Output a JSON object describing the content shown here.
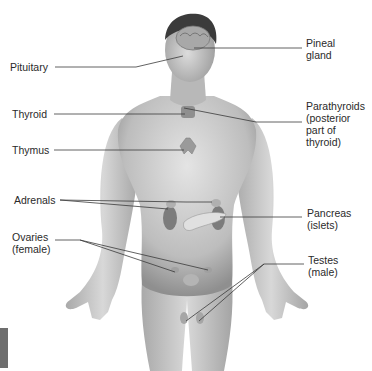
{
  "diagram": {
    "labels_left": [
      {
        "id": "pituitary",
        "text": "Pituitary",
        "x": 10,
        "y": 61
      },
      {
        "id": "thyroid",
        "text": "Thyroid",
        "x": 12,
        "y": 108
      },
      {
        "id": "thymus",
        "text": "Thymus",
        "x": 12,
        "y": 144
      },
      {
        "id": "adrenals",
        "text": "Adrenals",
        "x": 14,
        "y": 194
      },
      {
        "id": "ovaries",
        "text": "Ovaries\n(female)",
        "x": 12,
        "y": 231
      }
    ],
    "labels_right": [
      {
        "id": "pineal",
        "text": "Pineal\ngland",
        "x": 306,
        "y": 37
      },
      {
        "id": "parathyroids",
        "text": "Parathyroids\n(posterior\npart of\nthyroid)",
        "x": 306,
        "y": 100
      },
      {
        "id": "pancreas",
        "text": "Pancreas\n(islets)",
        "x": 307,
        "y": 207
      },
      {
        "id": "testes",
        "text": "Testes\n(male)",
        "x": 308,
        "y": 254
      }
    ],
    "colors": {
      "label_text": "#2a2a2a",
      "leader_line": "#3a3a3a",
      "skin": "#c9c9c9",
      "skin_shadow": "#9a9a9a",
      "hair": "#3b3b3b",
      "tab": "#6e6e6e"
    }
  }
}
